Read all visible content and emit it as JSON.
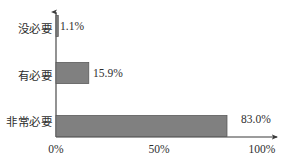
{
  "chart_data": {
    "type": "bar",
    "orientation": "horizontal",
    "title": "",
    "subtitle": "",
    "xlabel": "",
    "ylabel": "",
    "categories": [
      "没必要",
      "有必要",
      "非常必要"
    ],
    "values": [
      1.1,
      15.9,
      83.0
    ],
    "value_labels": [
      "1.1%",
      "15.9%",
      "83.0%"
    ],
    "xlim": [
      0,
      100
    ],
    "xticks": [
      0,
      50,
      100
    ],
    "xtick_labels": [
      "0%",
      "50%",
      "100%"
    ],
    "grid": false,
    "legend": false,
    "bar_color": "#808080",
    "bar_edge_color": "#5a5a5a",
    "axis_color": "#3a3a3a",
    "background": "#ffffff"
  },
  "bars": [
    {
      "category": "没必要",
      "value": 1.1,
      "value_label": "1.1%"
    },
    {
      "category": "有必要",
      "value": 15.9,
      "value_label": "15.9%"
    },
    {
      "category": "非常必要",
      "value": 83.0,
      "value_label": "83.0%"
    }
  ],
  "axis": {
    "ticks": [
      {
        "label": "0%",
        "value": 0
      },
      {
        "label": "50%",
        "value": 50
      },
      {
        "label": "100%",
        "value": 100
      }
    ]
  }
}
